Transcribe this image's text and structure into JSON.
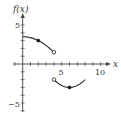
{
  "chart_data": {
    "type": "line",
    "title": "",
    "xlabel": "x",
    "ylabel": "f(x)",
    "xlim": [
      -2,
      11
    ],
    "ylim": [
      -6,
      7
    ],
    "grid": false,
    "x_ticks": [
      5,
      10
    ],
    "y_ticks": [
      5,
      -5
    ],
    "x_tick_labels": [
      "5",
      "10"
    ],
    "y_tick_labels": [
      "5",
      "−5"
    ],
    "series": [
      {
        "name": "piece 1",
        "x": [
          0,
          1,
          2,
          3,
          4
        ],
        "values": [
          3.5,
          3.375,
          3,
          2.375,
          1.5
        ],
        "domain": "0 ≤ x < 4",
        "markers": [
          {
            "x": 2,
            "y": 3,
            "style": "filled"
          },
          {
            "x": 4,
            "y": 1.5,
            "style": "open"
          }
        ]
      },
      {
        "name": "piece 2",
        "x": [
          4,
          5,
          6,
          7,
          8
        ],
        "values": [
          -2,
          -2.75,
          -3,
          -2.75,
          -2
        ],
        "domain": "4 < x ≤ 8",
        "markers": [
          {
            "x": 4,
            "y": -2,
            "style": "open"
          },
          {
            "x": 6,
            "y": -3,
            "style": "filled"
          }
        ]
      }
    ]
  },
  "labels": {
    "y_axis": "f(x)",
    "x_axis": "x",
    "x5": "5",
    "x10": "10",
    "y5": "5",
    "yneg5": "−5"
  }
}
